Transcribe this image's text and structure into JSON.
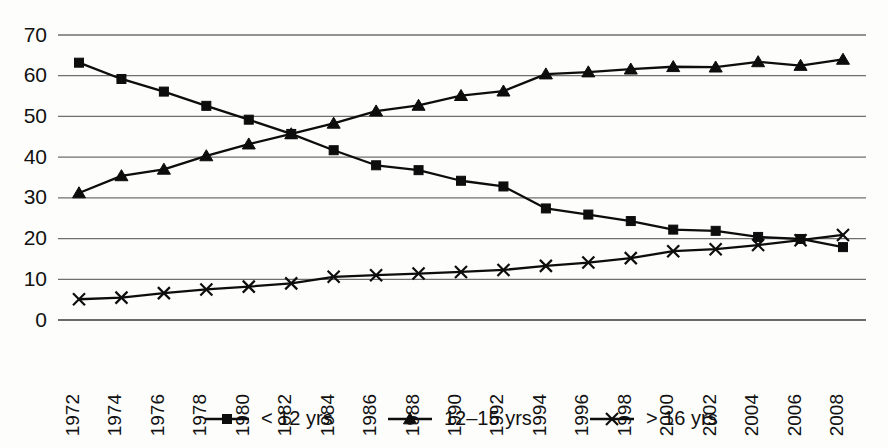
{
  "chart_data": {
    "type": "line",
    "title": "",
    "subtitle": "",
    "xlabel": "",
    "ylabel": "",
    "ylim": [
      0,
      70
    ],
    "yticks": [
      0,
      10,
      20,
      30,
      40,
      50,
      60,
      70
    ],
    "grid": true,
    "grid_axis": "y",
    "legend_position": "bottom",
    "x_tick_rotation": 90,
    "categories": [
      "1972",
      "1974",
      "1976",
      "1978",
      "1980",
      "1982",
      "1984",
      "1986",
      "1988",
      "1990",
      "1992",
      "1994",
      "1996",
      "1998",
      "2000",
      "2002",
      "2004",
      "2006",
      "2008"
    ],
    "series": [
      {
        "name": "< 12 yrs",
        "marker": "square",
        "values": [
          63.2,
          59.2,
          56.1,
          52.6,
          49.2,
          45.7,
          41.7,
          38.0,
          36.8,
          34.2,
          32.8,
          27.4,
          25.9,
          24.3,
          22.2,
          21.9,
          20.4,
          19.9,
          17.9
        ]
      },
      {
        "name": "12–15 yrs",
        "marker": "triangle",
        "values": [
          31.2,
          35.4,
          37.0,
          40.3,
          43.2,
          45.7,
          48.3,
          51.3,
          52.7,
          55.1,
          56.2,
          60.4,
          60.9,
          61.6,
          62.2,
          62.1,
          63.4,
          62.5,
          64.0
        ]
      },
      {
        "name": "> 16 yrs",
        "marker": "x",
        "values": [
          5.1,
          5.5,
          6.6,
          7.5,
          8.2,
          9.0,
          10.6,
          11.0,
          11.4,
          11.8,
          12.3,
          13.3,
          14.1,
          15.2,
          16.9,
          17.4,
          18.4,
          19.6,
          20.9
        ]
      }
    ],
    "colors": {
      "series_line": "#0d0d0d",
      "marker": "#0d0d0d",
      "gridline": "#6f6f6f",
      "axis": "#3a3a3a",
      "background": "#fdfdfc",
      "text": "#111111"
    }
  }
}
